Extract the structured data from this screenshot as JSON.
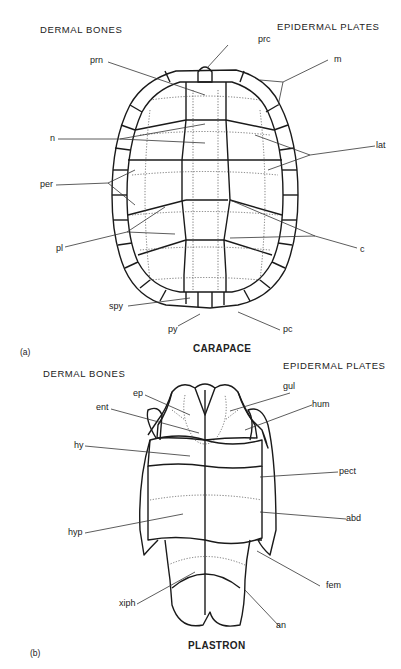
{
  "carapace": {
    "panel_label": "(a)",
    "title": "CARAPACE",
    "left_header": "DERMAL BONES",
    "right_header": "EPIDERMAL PLATES",
    "labels": {
      "prn": "prn",
      "prc": "prc",
      "m": "m",
      "n": "n",
      "lat": "lat",
      "per": "per",
      "pl": "pl",
      "c": "c",
      "spy": "spy",
      "py": "py",
      "pc": "pc"
    }
  },
  "plastron": {
    "panel_label": "(b)",
    "title": "PLASTRON",
    "left_header": "DERMAL BONES",
    "right_header": "EPIDERMAL PLATES",
    "labels": {
      "ep": "ep",
      "gul": "gul",
      "ent": "ent",
      "hum": "hum",
      "hy": "hy",
      "pect": "pect",
      "hyp": "hyp",
      "abd": "abd",
      "fem": "fem",
      "xiph": "xiph",
      "an": "an"
    }
  }
}
